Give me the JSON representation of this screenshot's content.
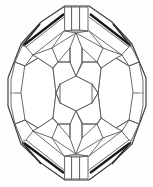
{
  "figure": {
    "title": "Faceted Gem Polyhedron Line Drawing",
    "view": "face-up / table view",
    "background_color": "#fefefe",
    "line_color": "#55565a",
    "outline_color": "#3a3b3f",
    "highlight_shadow_color": "#17181a",
    "canvas": {
      "width": 153,
      "height": 187
    },
    "symmetry": "bilateral vertical and horizontal",
    "outer_shape": "irregular octagon",
    "facet_count_label": "",
    "center_facet": "hexagon",
    "regions": {
      "crown_top": "top bevel with narrow rectangular keel facets",
      "left_pavilion": "octagonal side facet cluster",
      "right_pavilion": "octagonal side facet cluster",
      "table": "central hexagonal table facet",
      "culet_bottom": "bottom bevel with narrow rectangular keel facets"
    }
  },
  "geometry": {
    "outline_points": "76,4 112,22 136,47 146,86 136,128 112,156 76,182 40,156 16,128 7,86 16,47 40,22",
    "center": {
      "x": 76,
      "y": 93
    }
  }
}
